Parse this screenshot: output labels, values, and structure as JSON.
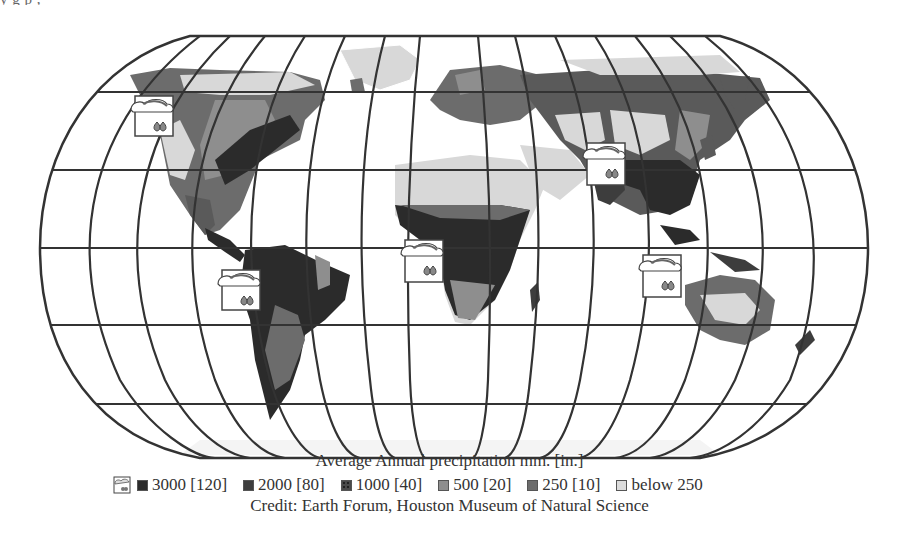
{
  "header": {
    "cropped_text": "y    g                          p    ,                  "
  },
  "map": {
    "projection": "Robinson-style world map with graticule",
    "title": "Average Annual precipitation mm. [in.]",
    "credit": "Credit: Earth Forum, Houston Museum of Natural Science",
    "colors": {
      "c3000": "#2b2b2b",
      "c2000": "#3d3d3d",
      "c1000": "#5a5a5a",
      "c500": "#8e8e8e",
      "c250": "#6c6c6c",
      "below250": "#d8d8d8",
      "ocean": "#ffffff",
      "grid": "#333333"
    },
    "weather_icons": [
      {
        "name": "north-america-rain-icon",
        "x": 132,
        "y": 96
      },
      {
        "name": "south-america-rain-icon",
        "x": 222,
        "y": 270
      },
      {
        "name": "africa-rain-icon",
        "x": 404,
        "y": 242
      },
      {
        "name": "south-asia-rain-icon",
        "x": 588,
        "y": 143
      },
      {
        "name": "indonesia-rain-icon",
        "x": 645,
        "y": 255
      }
    ]
  },
  "legend": {
    "title": "Average Annual precipitation mm. [in.]",
    "icon": "rain-cloud-icon",
    "items": [
      {
        "label": "3000 [120]",
        "color": "#2b2b2b"
      },
      {
        "label": "2000 [80]",
        "color": "#3d3d3d"
      },
      {
        "label": "1000 [40]",
        "color": "#4a4a4a"
      },
      {
        "label": "500 [20]",
        "color": "#8e8e8e"
      },
      {
        "label": "250 [10]",
        "color": "#6c6c6c"
      },
      {
        "label": "below 250",
        "color": "#dcdcdc"
      }
    ]
  },
  "credit": "Credit: Earth Forum, Houston Museum of Natural Science"
}
